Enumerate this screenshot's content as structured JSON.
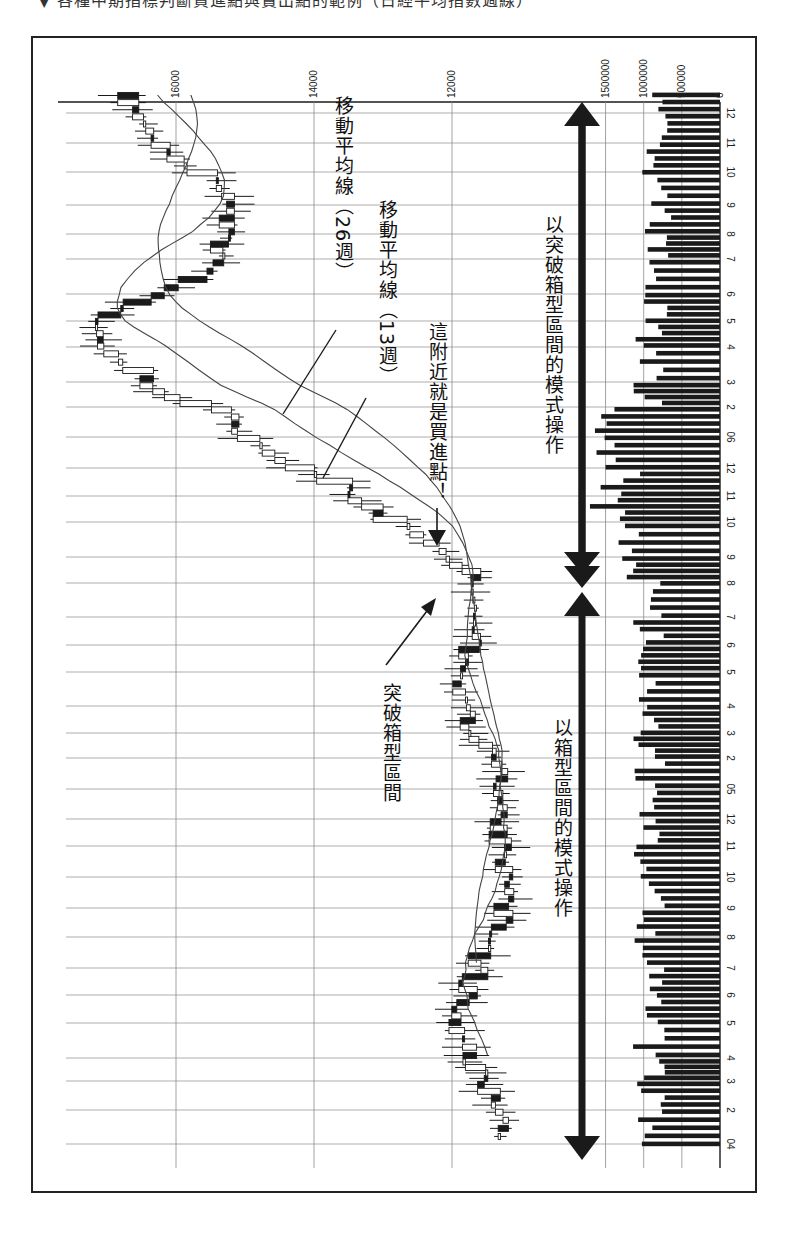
{
  "page": {
    "top_cut_text": "▼ 各種中期指標判斷買進點與賣出點的範例（日經平均指數週線）"
  },
  "chart_data": {
    "type": "candlestick",
    "title": "",
    "orientation": "rotated-90-clockwise (time runs bottom→top, price increases to the left)",
    "frequency": "weekly",
    "price_axis": {
      "ticks": [
        16000,
        14000,
        12000
      ],
      "tick_labels": [
        "16000",
        "14000",
        "12000"
      ],
      "range_approx": [
        11000,
        17700
      ]
    },
    "volume_axis": {
      "ticks": [
        1500000,
        1000000,
        500000,
        0
      ],
      "tick_labels": [
        "1500000",
        "1000000",
        "500000",
        "0"
      ]
    },
    "time_axis": {
      "labels_bottom_to_top": [
        "04",
        "2",
        "3",
        "4",
        "5",
        "6",
        "7",
        "8",
        "9",
        "10",
        "11",
        "12",
        "05",
        "2",
        "3",
        "4",
        "5",
        "6",
        "7",
        "8",
        "9",
        "10",
        "11",
        "12",
        "06",
        "2",
        "3",
        "4",
        "5",
        "6",
        "7",
        "8",
        "9",
        "10",
        "11",
        "12"
      ],
      "years": [
        "2004",
        "2005",
        "2006"
      ]
    },
    "series": [
      {
        "name": "週K線",
        "type": "candlestick"
      },
      {
        "name": "移動平均線（13週）",
        "type": "line"
      },
      {
        "name": "移動平均線（26週）",
        "type": "line"
      },
      {
        "name": "成交量",
        "type": "bar"
      }
    ],
    "price_path_approx": {
      "note": "approximate weekly close levels read from pixel positions",
      "x_month_index": [
        0,
        2,
        3,
        4,
        6,
        8,
        10,
        12,
        14,
        16,
        18,
        19,
        20,
        22,
        24,
        26,
        27,
        28,
        30,
        32,
        34,
        35
      ],
      "close": [
        11300,
        11500,
        11800,
        12000,
        11600,
        11200,
        11300,
        11300,
        11700,
        11900,
        11500,
        11700,
        12200,
        13500,
        15000,
        16400,
        17300,
        17000,
        15400,
        15300,
        16200,
        16700
      ]
    },
    "annotations": [
      {
        "text": "移動平均線（26週）",
        "target": "26-week moving average line"
      },
      {
        "text": "移動平均線（13週）",
        "target": "13-week moving average line"
      },
      {
        "text": "這附近就是買進點！",
        "target": "breakout candle around 2005-08"
      },
      {
        "text": "突破箱型區間",
        "target": "box range breakout around 2005-08"
      },
      {
        "text": "以突破箱型區間的模式操作",
        "span": "2005-08 → 2006-12"
      },
      {
        "text": "以箱型區間的模式操作",
        "span": "2004-01 → 2005-08"
      }
    ],
    "grid": true,
    "legend": "none"
  },
  "labels": {
    "ma26": "移動平均線（26週）",
    "ma13": "移動平均線（13週）",
    "buy_point": "這附近就是買進點！",
    "breakout": "突破箱型區間",
    "breakout_mode": "以突破箱型區間的模式操作",
    "box_mode": "以箱型區間的模式操作"
  },
  "colors": {
    "ink": "#1a1a1a",
    "grid": "#8a8a8a",
    "bull_fill": "#ffffff",
    "bear_fill": "#1a1a1a",
    "background": "#ffffff"
  }
}
